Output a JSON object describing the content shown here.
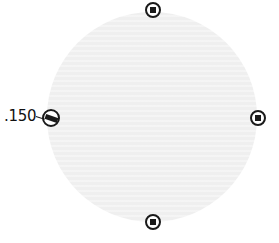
{
  "control": {
    "type": "radial-gradient-editor",
    "fill_color": "#efefef",
    "handle_color": "#1a1a1a",
    "handles": [
      {
        "position": "top",
        "icon": "circle-handle-icon"
      },
      {
        "position": "right",
        "icon": "circle-handle-icon"
      },
      {
        "position": "bottom",
        "icon": "circle-handle-icon"
      },
      {
        "position": "left",
        "icon": "rotation-handle-icon"
      }
    ],
    "angle_label": ".150"
  }
}
